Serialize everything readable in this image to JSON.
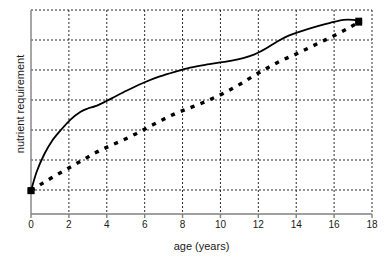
{
  "chart_data": {
    "type": "line",
    "title": "",
    "xlabel": "age (years)",
    "ylabel": "nutrient requirement",
    "xlim": [
      0,
      18
    ],
    "ylim": [
      0,
      7
    ],
    "xticks": [
      0,
      2,
      4,
      6,
      8,
      10,
      12,
      14,
      16,
      18
    ],
    "xticklabels": [
      "0",
      "2",
      "4",
      "6",
      "8",
      "10",
      "12",
      "14",
      "16",
      "18"
    ],
    "yticks": [],
    "yticklabels": [],
    "grid": true,
    "grid_style": "dotted",
    "legend": "none",
    "series": [
      {
        "name": "solid-curve",
        "style": "solid",
        "color": "#000000",
        "marker": "square-endpoints",
        "x": [
          0.0,
          0.3,
          0.7,
          1.1,
          1.6,
          2.1,
          2.6,
          3.0,
          3.4,
          3.9,
          4.5,
          5.2,
          6.0,
          6.8,
          7.6,
          8.4,
          9.2,
          10.0,
          10.6,
          11.2,
          11.8,
          12.4,
          13.0,
          13.6,
          14.2,
          15.0,
          15.8,
          16.5,
          17.0,
          17.3
        ],
        "y": [
          0.8,
          1.45,
          2.05,
          2.5,
          2.9,
          3.25,
          3.5,
          3.62,
          3.7,
          3.85,
          4.05,
          4.28,
          4.52,
          4.72,
          4.88,
          5.02,
          5.12,
          5.2,
          5.26,
          5.35,
          5.48,
          5.68,
          5.92,
          6.12,
          6.26,
          6.42,
          6.56,
          6.66,
          6.66,
          6.62
        ]
      },
      {
        "name": "dashed-curve",
        "style": "dashed",
        "color": "#000000",
        "marker": "square-endpoints",
        "x": [
          0.0,
          0.6,
          1.3,
          2.0,
          2.7,
          3.4,
          4.1,
          4.8,
          5.5,
          6.2,
          6.9,
          7.6,
          8.3,
          9.0,
          9.7,
          10.4,
          11.1,
          11.8,
          12.5,
          13.2,
          13.9,
          14.6,
          15.3,
          16.0,
          16.7,
          17.3
        ],
        "y": [
          0.8,
          1.05,
          1.32,
          1.58,
          1.84,
          2.1,
          2.32,
          2.52,
          2.74,
          2.98,
          3.22,
          3.44,
          3.62,
          3.8,
          4.0,
          4.22,
          4.48,
          4.76,
          5.02,
          5.26,
          5.46,
          5.68,
          5.9,
          6.12,
          6.36,
          6.58
        ]
      }
    ]
  },
  "axes": {
    "plot_left_px": 31,
    "plot_right_px": 372,
    "plot_top_px": 10,
    "plot_bottom_px": 214
  }
}
